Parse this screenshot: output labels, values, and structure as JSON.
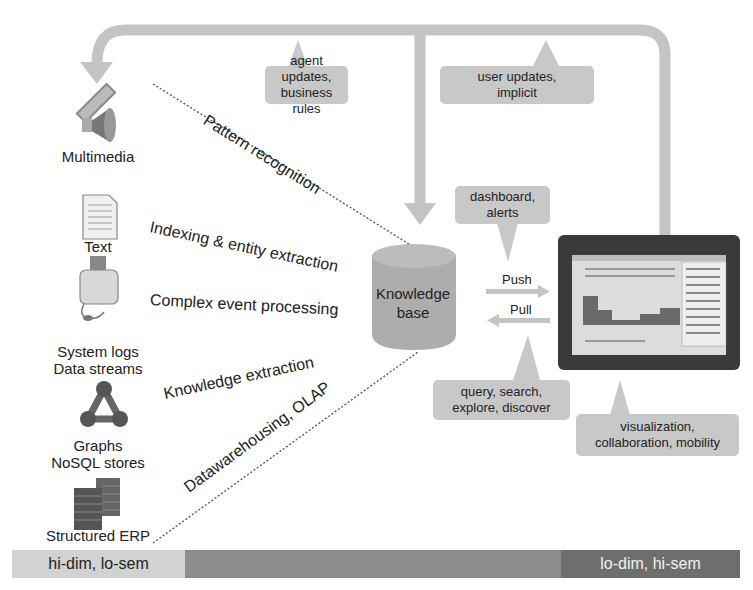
{
  "diagram": {
    "sources": [
      {
        "id": "multimedia",
        "label_lines": [
          "Multimedia"
        ],
        "icon": "multimedia-icon"
      },
      {
        "id": "text",
        "label_lines": [
          "Text"
        ],
        "icon": "document-icon"
      },
      {
        "id": "system-logs",
        "label_lines": [
          "System logs",
          "Data streams"
        ],
        "icon": "toaster-device-icon"
      },
      {
        "id": "graphs",
        "label_lines": [
          "Graphs",
          "NoSQL stores"
        ],
        "icon": "graph-network-icon"
      },
      {
        "id": "erp",
        "label_lines": [
          "Structured ERP"
        ],
        "icon": "server-stack-icon"
      }
    ],
    "processes": [
      {
        "label": "Pattern recognition"
      },
      {
        "label": "Indexing & entity extraction"
      },
      {
        "label": "Complex event processing"
      },
      {
        "label": "Knowledge extraction"
      },
      {
        "label": "Datawarehousing, OLAP"
      }
    ],
    "knowledge_base": {
      "line1": "Knowledge",
      "line2": "base"
    },
    "flows": {
      "push": "Push",
      "pull": "Pull"
    },
    "callouts": {
      "agent_updates": {
        "line1": "agent updates,",
        "line2": "business rules"
      },
      "user_updates": {
        "line1": "user updates,",
        "line2": "implicit"
      },
      "dashboard": {
        "line1": "dashboard, alerts"
      },
      "query": {
        "line1": "query, search,",
        "line2": "explore, discover"
      },
      "visualization": {
        "line1": "visualization,",
        "line2": "collaboration, mobility"
      }
    },
    "scale_band": {
      "left_label": "hi-dim, lo-sem",
      "right_label": "lo-dim, hi-sem"
    }
  },
  "colors": {
    "arrow_gray": "#c4c4c4",
    "callout_gray": "#c8c8c8",
    "band_light": "#d2d2d2",
    "band_mid": "#8c8c8c",
    "band_dark": "#6e6e6e",
    "tablet_frame": "#3a3a3a"
  }
}
